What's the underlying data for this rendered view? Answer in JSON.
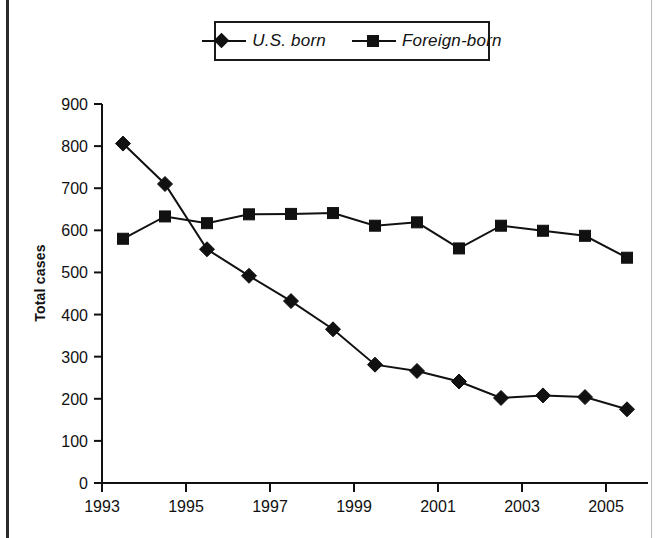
{
  "chart_data": {
    "type": "line",
    "title": "",
    "subtitle": "",
    "xlabel": "",
    "ylabel": "Total cases",
    "x": [
      1993.5,
      1994.5,
      1995.5,
      1996.5,
      1997.5,
      1998.5,
      1999.5,
      2000.5,
      2001.5,
      2002.5,
      2003.5,
      2004.5,
      2005.5
    ],
    "xlim": [
      1993,
      2006
    ],
    "ylim": [
      0,
      900
    ],
    "ytick_values": [
      0,
      100,
      200,
      300,
      400,
      500,
      600,
      700,
      800,
      900
    ],
    "ytick_labels": [
      "0",
      "100",
      "200",
      "300",
      "400",
      "500",
      "600",
      "700",
      "800",
      "900"
    ],
    "xtick_values": [
      1993,
      1995,
      1997,
      1999,
      2001,
      2003,
      2005
    ],
    "xtick_labels": [
      "1993",
      "1995",
      "1997",
      "1999",
      "2001",
      "2003",
      "2005"
    ],
    "grid": false,
    "legend_position": "top-center",
    "series": [
      {
        "name": "U.S. born",
        "marker": "diamond",
        "color": "#111111",
        "values": [
          806,
          710,
          555,
          492,
          432,
          365,
          281,
          266,
          241,
          202,
          208,
          204,
          175
        ]
      },
      {
        "name": "Foreign-born",
        "marker": "square",
        "color": "#111111",
        "values": [
          580,
          633,
          617,
          638,
          639,
          641,
          611,
          619,
          557,
          611,
          599,
          587,
          535
        ]
      }
    ]
  },
  "legend": {
    "entries": [
      {
        "label": "U.S. born",
        "marker": "diamond"
      },
      {
        "label": "Foreign-born",
        "marker": "square"
      }
    ]
  },
  "axes": {
    "y_title": "Total cases"
  },
  "colors": {
    "ink": "#111111",
    "background": "#ffffff",
    "frame": "#2b2b2b"
  }
}
